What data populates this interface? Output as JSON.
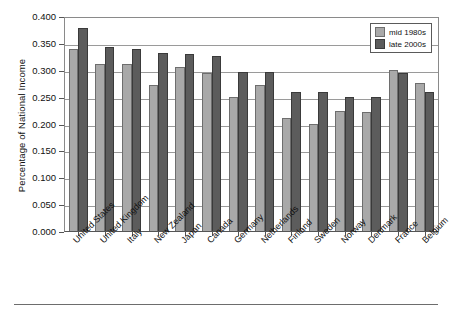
{
  "chart_data": {
    "type": "bar",
    "title": "",
    "xlabel": "",
    "ylabel": "Percentage of National Income",
    "ylim": [
      0.0,
      0.4
    ],
    "ytick_labels": [
      "0.400",
      "0.350",
      "0.300",
      "0.250",
      "0.200",
      "0.150",
      "0.100",
      "0.050",
      "0.000"
    ],
    "ytick_values": [
      0.4,
      0.35,
      0.3,
      0.25,
      0.2,
      0.15,
      0.1,
      0.05,
      0.0
    ],
    "grid": true,
    "legend_position": "top-right",
    "categories": [
      "United States",
      "United Kingdom",
      "Italy",
      "New Zealand",
      "Japan",
      "Canada",
      "Germany",
      "Netherlands",
      "Finland",
      "Sweden",
      "Norway",
      "Denmark",
      "France",
      "Belgium"
    ],
    "series": [
      {
        "name": "mid 1980s",
        "color": "#a9a9a9",
        "values": [
          0.338,
          0.31,
          0.31,
          0.272,
          0.305,
          0.294,
          0.25,
          0.272,
          0.21,
          0.199,
          0.223,
          0.222,
          0.3,
          0.275
        ]
      },
      {
        "name": "late 2000s",
        "color": "#5c5c5c",
        "values": [
          0.378,
          0.343,
          0.338,
          0.331,
          0.33,
          0.326,
          0.296,
          0.295,
          0.259,
          0.259,
          0.25,
          0.25,
          0.294,
          0.259
        ]
      }
    ]
  },
  "legend": {
    "items": [
      {
        "label": "mid 1980s"
      },
      {
        "label": "late 2000s"
      }
    ]
  }
}
